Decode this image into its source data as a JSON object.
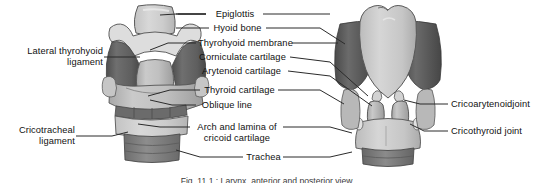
{
  "figure": {
    "caption": "Fig. 11.1 : Larynx, anterior and posterior view."
  },
  "labels": {
    "center": [
      {
        "text": "Epiglottis"
      },
      {
        "text": "Hyoid bone"
      },
      {
        "text": "Thyrohyoid membrane"
      },
      {
        "text": "Corniculate cartilage"
      },
      {
        "text": "Arytenoid cartilage"
      },
      {
        "text": "Thyroid cartilage"
      },
      {
        "text": "Oblique line"
      },
      {
        "text": "Arch and lamina of"
      },
      {
        "text": "cricoid cartilage"
      },
      {
        "text": "Trachea"
      }
    ],
    "left": [
      {
        "line1": "Lateral thyrohyoid",
        "line2": "ligament"
      },
      {
        "line1": "Cricotracheal",
        "line2": "ligament"
      }
    ],
    "right": [
      {
        "text": "Cricoarytenoidjoint"
      },
      {
        "text": "Cricothyroid joint"
      }
    ]
  },
  "colors": {
    "line": "#2b2b2b",
    "cartilage_light": "#cfcfcf",
    "cartilage_mid": "#b0b0b0",
    "membrane_dark": "#6e6e6e",
    "membrane_darker": "#545454",
    "trachea": "#8a8a8a",
    "outline": "#4a4a4a"
  }
}
